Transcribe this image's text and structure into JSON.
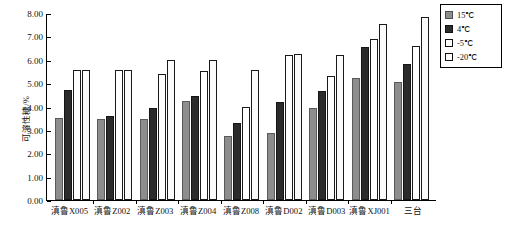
{
  "chart_data": {
    "type": "bar",
    "title": "",
    "xlabel": "",
    "ylabel": "可溶性糖/%",
    "ylim": [
      0,
      8
    ],
    "ytick_step": 1,
    "ytick_labels": [
      "8.00",
      "7.00",
      "6.00",
      "5.00",
      "4.00",
      "3.00",
      "2.00",
      "1.00",
      "0.00"
    ],
    "grid": false,
    "legend_position": "right-top",
    "categories": [
      "滇鲁X005",
      "滇鲁Z002",
      "滇鲁Z003",
      "滇鲁Z004",
      "滇鲁Z008",
      "滇鲁D002",
      "滇鲁D003",
      "滇鲁XJ001",
      "三台"
    ],
    "series": [
      {
        "name": "15℃",
        "color": "#8d8d8d",
        "values": [
          3.5,
          3.45,
          3.48,
          4.25,
          2.75,
          2.85,
          3.95,
          5.2,
          5.05
        ]
      },
      {
        "name": "4℃",
        "color": "#2b2b2b",
        "values": [
          4.7,
          3.58,
          3.95,
          4.45,
          3.3,
          4.2,
          4.65,
          6.55,
          5.8
        ]
      },
      {
        "name": "-5℃",
        "color": "#ffffff",
        "values": [
          5.55,
          5.55,
          5.4,
          5.5,
          4.0,
          6.2,
          5.3,
          6.9,
          6.6
        ]
      },
      {
        "name": "-20℃",
        "color": "#ffffff",
        "values": [
          5.58,
          5.58,
          6.0,
          6.0,
          5.55,
          6.25,
          6.2,
          7.55,
          7.85
        ]
      }
    ]
  },
  "legend": {
    "items": [
      {
        "label": "15℃"
      },
      {
        "label": "4℃"
      },
      {
        "label": "-5℃"
      },
      {
        "label": "-20℃"
      }
    ]
  }
}
